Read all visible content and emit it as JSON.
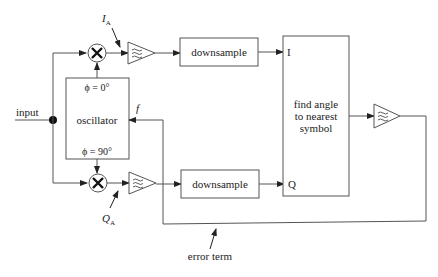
{
  "diagram": {
    "input_label": "input",
    "oscillator": {
      "label": "oscillator",
      "phase_top": "ϕ = 0°",
      "phase_bottom": "ϕ = 90°",
      "freq_input_label": "f"
    },
    "mixers": [
      {
        "id": "mixer-i",
        "symbol": "✕"
      },
      {
        "id": "mixer-q",
        "symbol": "✕"
      }
    ],
    "filters": [
      {
        "id": "lowpass-filter-i",
        "icon": "lowpass-filter-icon"
      },
      {
        "id": "lowpass-filter-q",
        "icon": "lowpass-filter-icon"
      },
      {
        "id": "loop-filter",
        "icon": "lowpass-filter-icon"
      }
    ],
    "downsample_top": "downsample",
    "downsample_bottom": "downsample",
    "decision_block": {
      "line1": "find angle",
      "line2": "to nearest",
      "line3": "symbol",
      "input_i": "I",
      "input_q": "Q"
    },
    "annotations": {
      "i_a": {
        "main": "I",
        "sub": "A"
      },
      "q_a": {
        "main": "Q",
        "sub": "A"
      },
      "error_term": "error term"
    }
  }
}
